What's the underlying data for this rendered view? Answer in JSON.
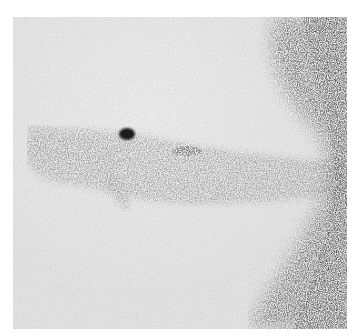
{
  "image": {
    "kind": "grayscale scintigraphy-style photograph",
    "background_color": "#ffffff",
    "field_color": "#e6e6e6",
    "frame": {
      "x": 13,
      "y": 17,
      "width": 334,
      "height": 312
    },
    "features": [
      {
        "name": "dark-focal-spot",
        "cx": 114,
        "cy": 117,
        "rx": 8,
        "ry": 6,
        "color": "#141414"
      },
      {
        "name": "secondary-smudge",
        "cx": 174,
        "cy": 134,
        "rx": 15,
        "ry": 5,
        "color": "#5a5a5a"
      },
      {
        "name": "horizontal-band",
        "description": "diffuse speckled band crossing the frame from left to right around y≈120–190"
      },
      {
        "name": "right-dark-edge",
        "description": "dense speckled darker region along the right edge, widening toward top and bottom"
      }
    ]
  }
}
